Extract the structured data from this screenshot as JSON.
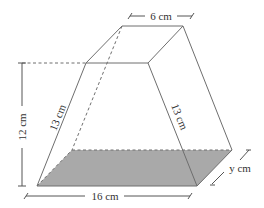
{
  "figure": {
    "type": "frustum-prism-diagram",
    "colors": {
      "edge": "#6e6e6e",
      "base_shading": "#a9a9a9",
      "text": "#333333",
      "background": "#ffffff"
    }
  },
  "labels": {
    "top_width": "6 cm",
    "height": "12 cm",
    "left_slant": "13 cm",
    "right_slant": "13 cm",
    "base_width": "16 cm",
    "base_depth": "y cm"
  }
}
